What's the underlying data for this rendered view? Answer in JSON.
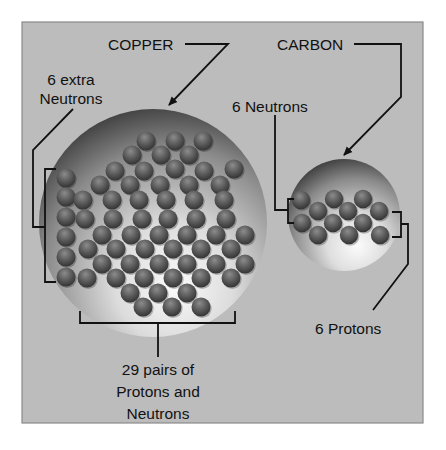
{
  "diagram": {
    "colors": {
      "page_background": "#ffffff",
      "panel_background": "#bcbcbc",
      "panel_border": "#8a8a8a",
      "line": "#111111",
      "ball": "#5a5a5a",
      "sphere_dark": "#4a4a4a",
      "sphere_light": "#f4f4f4"
    },
    "labels": {
      "copper": "COPPER",
      "carbon": "CARBON",
      "extra_neutrons_line1": "6 extra",
      "extra_neutrons_line2": "Neutrons",
      "carbon_neutrons": "6 Neutrons",
      "carbon_protons": "6 Protons",
      "pairs_line1": "29 pairs of",
      "pairs_line2": "Protons and",
      "pairs_line3": "Neutrons"
    },
    "copper_nucleus": {
      "center": [
        153,
        223
      ],
      "radius": 114,
      "ball_radius": 9.5,
      "balls": [
        [
          146,
          141
        ],
        [
          175,
          141
        ],
        [
          203,
          141
        ],
        [
          132,
          155
        ],
        [
          161,
          155
        ],
        [
          189,
          155
        ],
        [
          115,
          171
        ],
        [
          144,
          171
        ],
        [
          175,
          169
        ],
        [
          204,
          171
        ],
        [
          234,
          169
        ],
        [
          100,
          185
        ],
        [
          130,
          185
        ],
        [
          160,
          185
        ],
        [
          189,
          185
        ],
        [
          220,
          185
        ],
        [
          66,
          178
        ],
        [
          66,
          197
        ],
        [
          66,
          217
        ],
        [
          66,
          237
        ],
        [
          66,
          257
        ],
        [
          66,
          277
        ],
        [
          83,
          200
        ],
        [
          112,
          200
        ],
        [
          139,
          200
        ],
        [
          166,
          200
        ],
        [
          194,
          200
        ],
        [
          224,
          200
        ],
        [
          85,
          219
        ],
        [
          113,
          219
        ],
        [
          142,
          219
        ],
        [
          168,
          219
        ],
        [
          196,
          219
        ],
        [
          226,
          219
        ],
        [
          102,
          235
        ],
        [
          131,
          235
        ],
        [
          159,
          235
        ],
        [
          187,
          235
        ],
        [
          216,
          235
        ],
        [
          245,
          235
        ],
        [
          88,
          249
        ],
        [
          116,
          249
        ],
        [
          145,
          249
        ],
        [
          173,
          249
        ],
        [
          201,
          249
        ],
        [
          231,
          249
        ],
        [
          102,
          264
        ],
        [
          130,
          264
        ],
        [
          159,
          264
        ],
        [
          187,
          264
        ],
        [
          216,
          264
        ],
        [
          245,
          264
        ],
        [
          87,
          278
        ],
        [
          116,
          278
        ],
        [
          144,
          278
        ],
        [
          173,
          278
        ],
        [
          201,
          278
        ],
        [
          231,
          278
        ],
        [
          130,
          293
        ],
        [
          158,
          293
        ],
        [
          187,
          293
        ],
        [
          143,
          307
        ],
        [
          172,
          307
        ],
        [
          201,
          307
        ]
      ]
    },
    "carbon_nucleus": {
      "center": [
        344,
        215
      ],
      "radius": 56,
      "ball_radius": 9.2,
      "balls": [
        [
          301,
          200
        ],
        [
          334,
          199
        ],
        [
          363,
          199
        ],
        [
          318,
          211
        ],
        [
          348,
          211
        ],
        [
          379,
          211
        ],
        [
          302,
          223
        ],
        [
          333,
          223
        ],
        [
          363,
          223
        ],
        [
          318,
          235
        ],
        [
          349,
          235
        ],
        [
          380,
          235
        ]
      ]
    }
  }
}
